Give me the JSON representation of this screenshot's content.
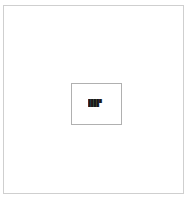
{
  "page": {
    "background_color": "#ffffff",
    "frame_border_color": "#cfcfcf"
  },
  "dialog": {
    "border_color": "#b0b0b0",
    "background_color": "#ffffff",
    "text_color": "#1a1a1a",
    "lines": [
      "█████",
      "████"
    ]
  }
}
